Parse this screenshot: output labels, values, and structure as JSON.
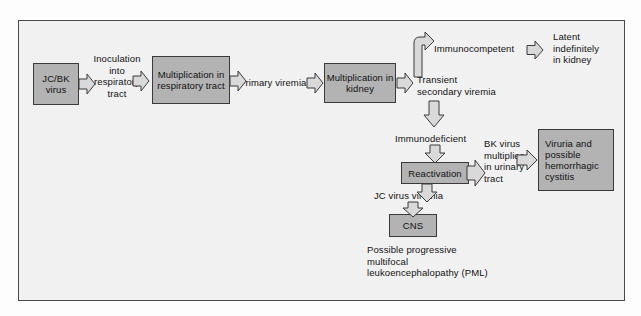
{
  "figure": {
    "frame_border_color": "#4a4a4a",
    "panel_background": "#f1f1f1",
    "node_fill": "#b3b3b3",
    "node_border": "#3a3a3a",
    "arrow_fill": "#d6d6d6",
    "arrow_stroke": "#3a3a3a",
    "text_color": "#111111"
  },
  "nodes": [
    {
      "id": "jcbk",
      "label": "JC/BK\nvirus"
    },
    {
      "id": "mult_resp",
      "label": "Multiplication\nin respiratory\ntract"
    },
    {
      "id": "mult_kidney",
      "label": "Multiplication\nin kidney"
    },
    {
      "id": "reactivation",
      "label": "Reactivation"
    },
    {
      "id": "cns",
      "label": "CNS"
    },
    {
      "id": "viruria",
      "label": "Viruria and\npossible\nhemorrhagic\ncystitis"
    }
  ],
  "labels": [
    {
      "id": "inoculation",
      "text": "Inoculation\ninto\nrespiratory\ntract"
    },
    {
      "id": "primary_viremia",
      "text": "Primary viremia"
    },
    {
      "id": "transient",
      "text": "Transient\nsecondary viremia"
    },
    {
      "id": "immunocompetent",
      "text": "Immunocompetent"
    },
    {
      "id": "latent",
      "text": "Latent\nindefinitely\nin kidney"
    },
    {
      "id": "immunodeficient",
      "text": "Immunodeficient"
    },
    {
      "id": "bk_multiplies",
      "text": "BK virus\nmultiplies\nin urinary\ntract"
    },
    {
      "id": "jc_viremia",
      "text": "JC virus viremia"
    },
    {
      "id": "pml",
      "text": "Possible progressive\nmultifocal\nleukoencephalopathy (PML)"
    }
  ],
  "arrows": [
    {
      "id": "jcbk-to-inoculation",
      "direction": "right"
    },
    {
      "id": "inoculation-to-mult-resp",
      "direction": "right"
    },
    {
      "id": "mult-resp-to-primary-viremia",
      "direction": "right"
    },
    {
      "id": "primary-viremia-to-kidney",
      "direction": "right"
    },
    {
      "id": "kidney-to-transient",
      "direction": "right"
    },
    {
      "id": "transient-to-immunocompetent",
      "direction": "elbow-up-right"
    },
    {
      "id": "immunocompetent-to-latent",
      "direction": "right"
    },
    {
      "id": "transient-to-immunodeficient",
      "direction": "down"
    },
    {
      "id": "immunodeficient-to-reactivation",
      "direction": "down"
    },
    {
      "id": "reactivation-to-bk",
      "direction": "right"
    },
    {
      "id": "bk-to-viruria",
      "direction": "right"
    },
    {
      "id": "reactivation-to-jc-viremia",
      "direction": "down"
    },
    {
      "id": "jc-viremia-to-cns",
      "direction": "down"
    }
  ]
}
